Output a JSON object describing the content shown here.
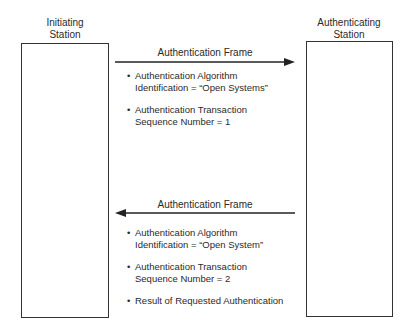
{
  "initiating_station": {
    "label": "Initiating\nStation"
  },
  "authenticating_station": {
    "label": "Authenticating\nStation"
  },
  "frames": [
    {
      "label": "Authentication Frame",
      "direction": "initiating-to-authenticating",
      "bullets": [
        "Authentication Algorithm\nIdentification = “Open Systems”",
        "Authentication Transaction\nSequence Number = 1"
      ]
    },
    {
      "label": "Authentication Frame",
      "direction": "authenticating-to-initiating",
      "bullets": [
        "Authentication Algorithm\nIdentification = “Open System”",
        "Authentication Transaction\nSequence Number = 2",
        "Result of Requested Authentication"
      ]
    }
  ]
}
